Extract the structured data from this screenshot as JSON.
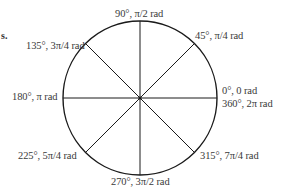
{
  "figure": {
    "edge_fragment": "s.",
    "circle": {
      "cx": 140,
      "cy": 98,
      "r": 77,
      "stroke": "#1a1a1a"
    },
    "angles": [
      {
        "deg": 0,
        "label": "0°, 0 rad"
      },
      {
        "deg": 45,
        "label": "45°, π/4 rad"
      },
      {
        "deg": 90,
        "label": "90°, π/2 rad"
      },
      {
        "deg": 135,
        "label": "135°, 3π/4 rad"
      },
      {
        "deg": 180,
        "label": "180°, π rad"
      },
      {
        "deg": 225,
        "label": "225°, 5π/4 rad"
      },
      {
        "deg": 270,
        "label": "270°, 3π/2 rad"
      },
      {
        "deg": 315,
        "label": "315°, 7π/4 rad"
      },
      {
        "deg": 360,
        "label": "360°, 2π rad"
      }
    ],
    "labels": {
      "a0": "0°, 0 rad",
      "a360": "360°, 2π rad",
      "a45": "45°, π/4 rad",
      "a90": "90°, π/2 rad",
      "a135": "135°, 3π/4 rad",
      "a180": "180°, π rad",
      "a225": "225°, 5π/4 rad",
      "a270": "270°, 3π/2 rad",
      "a315": "315°, 7π/4 rad"
    },
    "colors": {
      "line": "#1a1a1a",
      "text": "#3a3a3a",
      "background": "#ffffff"
    }
  }
}
